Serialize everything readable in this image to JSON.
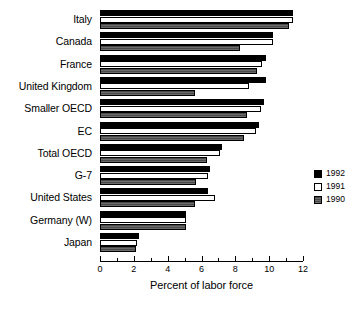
{
  "chart_data": {
    "type": "bar",
    "orientation": "horizontal",
    "title": "",
    "subtitle": "",
    "xlabel": "Percent of labor force",
    "ylabel": "",
    "xlim": [
      0,
      12
    ],
    "xticks": [
      0,
      2,
      4,
      6,
      8,
      10,
      12
    ],
    "xtick_labels": [
      "0",
      "2",
      "4",
      "6",
      "8",
      "10",
      "12"
    ],
    "minor_xticks": [
      1,
      3,
      5,
      7,
      9,
      11
    ],
    "grid": false,
    "legend_position": "right",
    "categories": [
      "Italy",
      "Canada",
      "France",
      "United Kingdom",
      "Smaller OECD",
      "EC",
      "Total OECD",
      "G-7",
      "United States",
      "Germany (W)",
      "Japan"
    ],
    "series": [
      {
        "name": "1992",
        "color": "#000000",
        "values": [
          11.4,
          10.2,
          9.8,
          9.8,
          9.7,
          9.4,
          7.2,
          6.5,
          6.4,
          5.1,
          2.3
        ]
      },
      {
        "name": "1991",
        "color": "#ffffff",
        "values": [
          11.4,
          10.2,
          9.6,
          8.8,
          9.5,
          9.2,
          7.1,
          6.4,
          6.8,
          5.1,
          2.2
        ]
      },
      {
        "name": "1990",
        "color": "#595959",
        "values": [
          11.2,
          8.3,
          9.3,
          5.6,
          8.7,
          8.5,
          6.3,
          5.7,
          5.6,
          5.1,
          2.1
        ]
      }
    ]
  }
}
